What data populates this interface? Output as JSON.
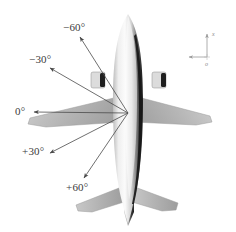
{
  "figure": {
    "kind": "aircraft-top-view-angle-diagram",
    "caption_fragment": "",
    "background_color": "#ffffff",
    "line_color": "#4a4a4a",
    "label_color": "#3a3a3a"
  },
  "angle_labels": [
    {
      "id": "minus60",
      "text": "−60°",
      "value": -60
    },
    {
      "id": "minus30",
      "text": "−30°",
      "value": -30
    },
    {
      "id": "zero",
      "text": "0°",
      "value": 0
    },
    {
      "id": "plus30",
      "text": "+30°",
      "value": 30
    },
    {
      "id": "plus60",
      "text": "+60°",
      "value": 60
    }
  ],
  "axes_indicator": {
    "vertical_label": "x",
    "origin_label": "o"
  },
  "aircraft": {
    "fuselage_fill_light": "#f2f2f2",
    "fuselage_fill_mid": "#b9b9b9",
    "fuselage_fill_dark": "#2a2a2a",
    "wing_fill": "#b0b0b0",
    "tail_fill": "#b8b8b8",
    "engine_fill": "#d8d8d8",
    "engine_dark": "#1f1f1f"
  }
}
